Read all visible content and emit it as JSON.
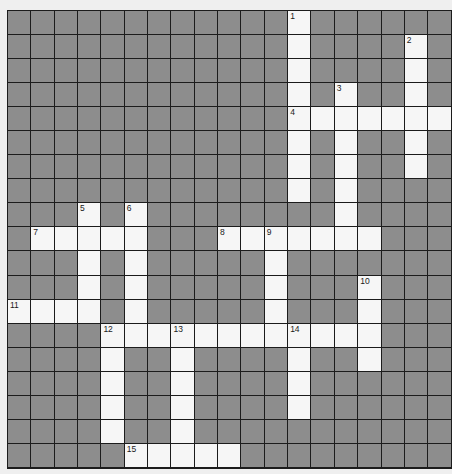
{
  "puzzle": {
    "rows": 19,
    "cols": 19,
    "colors": {
      "block": "#8d8d8d",
      "open": "#f6f6f6",
      "gridline": "#1c1c1c",
      "number": "#1a1a1a"
    },
    "open_cells": [
      [
        0,
        12
      ],
      [
        1,
        12
      ],
      [
        1,
        17
      ],
      [
        2,
        12
      ],
      [
        2,
        17
      ],
      [
        3,
        12
      ],
      [
        3,
        14
      ],
      [
        3,
        17
      ],
      [
        4,
        12
      ],
      [
        4,
        13
      ],
      [
        4,
        14
      ],
      [
        4,
        15
      ],
      [
        4,
        16
      ],
      [
        4,
        17
      ],
      [
        4,
        18
      ],
      [
        5,
        12
      ],
      [
        5,
        14
      ],
      [
        5,
        17
      ],
      [
        6,
        12
      ],
      [
        6,
        14
      ],
      [
        6,
        17
      ],
      [
        7,
        12
      ],
      [
        7,
        14
      ],
      [
        8,
        3
      ],
      [
        8,
        5
      ],
      [
        8,
        14
      ],
      [
        9,
        1
      ],
      [
        9,
        2
      ],
      [
        9,
        3
      ],
      [
        9,
        4
      ],
      [
        9,
        5
      ],
      [
        9,
        9
      ],
      [
        9,
        10
      ],
      [
        9,
        11
      ],
      [
        9,
        12
      ],
      [
        9,
        13
      ],
      [
        9,
        14
      ],
      [
        9,
        15
      ],
      [
        10,
        3
      ],
      [
        10,
        5
      ],
      [
        10,
        11
      ],
      [
        11,
        3
      ],
      [
        11,
        5
      ],
      [
        11,
        11
      ],
      [
        11,
        15
      ],
      [
        12,
        0
      ],
      [
        12,
        1
      ],
      [
        12,
        2
      ],
      [
        12,
        3
      ],
      [
        12,
        5
      ],
      [
        12,
        11
      ],
      [
        12,
        15
      ],
      [
        13,
        4
      ],
      [
        13,
        5
      ],
      [
        13,
        6
      ],
      [
        13,
        7
      ],
      [
        13,
        8
      ],
      [
        13,
        9
      ],
      [
        13,
        10
      ],
      [
        13,
        11
      ],
      [
        13,
        12
      ],
      [
        13,
        13
      ],
      [
        13,
        14
      ],
      [
        13,
        15
      ],
      [
        14,
        4
      ],
      [
        14,
        7
      ],
      [
        14,
        12
      ],
      [
        14,
        15
      ],
      [
        15,
        4
      ],
      [
        15,
        7
      ],
      [
        15,
        12
      ],
      [
        16,
        4
      ],
      [
        16,
        7
      ],
      [
        16,
        12
      ],
      [
        17,
        4
      ],
      [
        17,
        7
      ],
      [
        18,
        5
      ],
      [
        18,
        6
      ],
      [
        18,
        7
      ],
      [
        18,
        8
      ],
      [
        18,
        9
      ]
    ],
    "numbers": [
      {
        "row": 0,
        "col": 12,
        "label": "1"
      },
      {
        "row": 1,
        "col": 17,
        "label": "2"
      },
      {
        "row": 3,
        "col": 14,
        "label": "3"
      },
      {
        "row": 4,
        "col": 12,
        "label": "4"
      },
      {
        "row": 8,
        "col": 3,
        "label": "5"
      },
      {
        "row": 8,
        "col": 5,
        "label": "6"
      },
      {
        "row": 9,
        "col": 1,
        "label": "7"
      },
      {
        "row": 9,
        "col": 9,
        "label": "8"
      },
      {
        "row": 9,
        "col": 11,
        "label": "9"
      },
      {
        "row": 11,
        "col": 15,
        "label": "10"
      },
      {
        "row": 12,
        "col": 0,
        "label": "11"
      },
      {
        "row": 13,
        "col": 4,
        "label": "12"
      },
      {
        "row": 13,
        "col": 7,
        "label": "13"
      },
      {
        "row": 13,
        "col": 12,
        "label": "14"
      },
      {
        "row": 18,
        "col": 5,
        "label": "15"
      }
    ],
    "entries": {
      "across": [
        {
          "label": "4",
          "row": 4,
          "col": 12,
          "length": 7
        },
        {
          "label": "7",
          "row": 9,
          "col": 1,
          "length": 5
        },
        {
          "label": "8",
          "row": 9,
          "col": 9,
          "length": 7
        },
        {
          "label": "11",
          "row": 12,
          "col": 0,
          "length": 4
        },
        {
          "label": "12",
          "row": 13,
          "col": 4,
          "length": 12
        },
        {
          "label": "15",
          "row": 18,
          "col": 5,
          "length": 5
        }
      ],
      "down": [
        {
          "label": "1",
          "row": 0,
          "col": 12,
          "length": 8
        },
        {
          "label": "2",
          "row": 1,
          "col": 17,
          "length": 6
        },
        {
          "label": "3",
          "row": 3,
          "col": 14,
          "length": 7
        },
        {
          "label": "5",
          "row": 8,
          "col": 3,
          "length": 5
        },
        {
          "label": "6",
          "row": 8,
          "col": 5,
          "length": 6
        },
        {
          "label": "9",
          "row": 9,
          "col": 11,
          "length": 5
        },
        {
          "label": "10",
          "row": 11,
          "col": 15,
          "length": 4
        },
        {
          "label": "12",
          "row": 13,
          "col": 4,
          "length": 5
        },
        {
          "label": "13",
          "row": 13,
          "col": 7,
          "length": 6
        },
        {
          "label": "14",
          "row": 13,
          "col": 12,
          "length": 4
        }
      ]
    }
  }
}
